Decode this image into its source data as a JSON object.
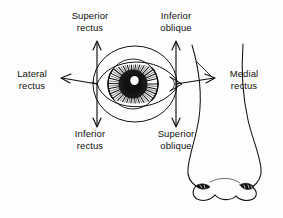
{
  "figure": {
    "background_color": "#fdfdfd",
    "ink_color": "#111111"
  },
  "labels": {
    "superior_rectus": {
      "line1": "Superior",
      "line2": "rectus"
    },
    "inferior_oblique": {
      "line1": "Inferior",
      "line2": "oblique"
    },
    "lateral_rectus": {
      "line1": "Lateral",
      "line2": "rectus"
    },
    "medial_rectus": {
      "line1": "Medial",
      "line2": "rectus"
    },
    "inferior_rectus": {
      "line1": "Inferior",
      "line2": "rectus"
    },
    "superior_oblique": {
      "line1": "Superior",
      "line2": "oblique"
    }
  },
  "arrows": [
    {
      "name": "superior-rectus-arrow",
      "direction": "up",
      "label": "Superior rectus"
    },
    {
      "name": "inferior-rectus-arrow",
      "direction": "down",
      "label": "Inferior rectus"
    },
    {
      "name": "inferior-oblique-arrow",
      "direction": "up",
      "label": "Inferior oblique"
    },
    {
      "name": "superior-oblique-arrow",
      "direction": "down",
      "label": "Superior oblique"
    },
    {
      "name": "lateral-rectus-arrow",
      "direction": "left",
      "label": "Lateral rectus"
    },
    {
      "name": "medial-rectus-arrow",
      "direction": "right",
      "label": "Medial rectus"
    }
  ],
  "anatomy": {
    "eye": "right eye with eyelid aperture, eyeball circle, striated iris and dark pupil",
    "nose": "outline of a nose with two nostrils"
  }
}
